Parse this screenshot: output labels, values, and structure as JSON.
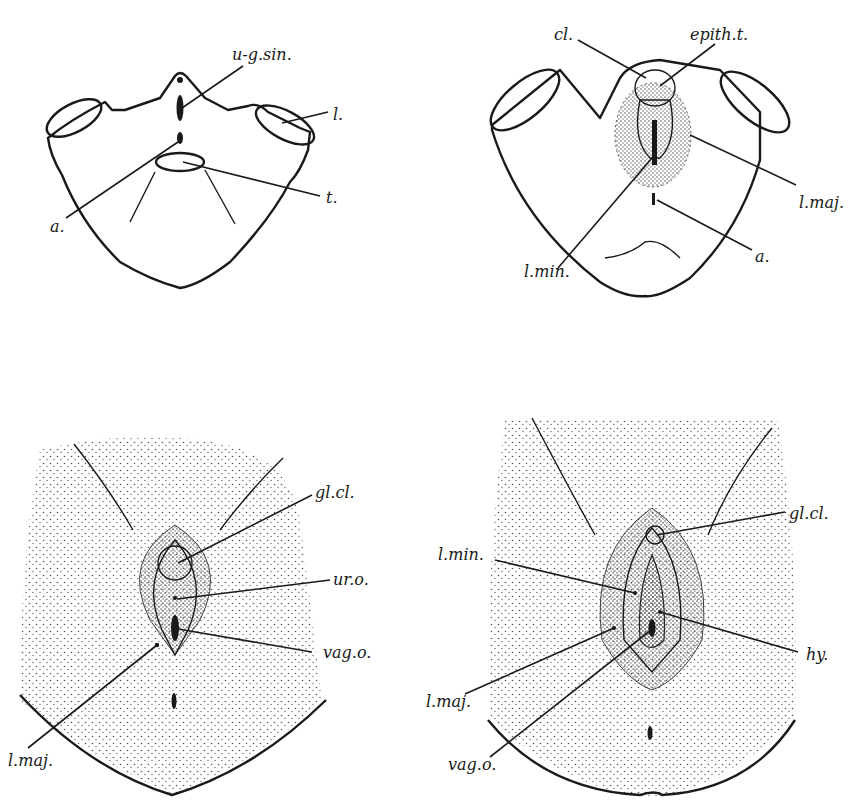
{
  "figure": {
    "panels": [
      {
        "id": "top-left",
        "labels": [
          {
            "text": "u-g.sin.",
            "meaning": "urogenital sinus"
          },
          {
            "text": "l.",
            "meaning": "leg"
          },
          {
            "text": "t.",
            "meaning": "tail"
          },
          {
            "text": "a.",
            "meaning": "anus"
          }
        ]
      },
      {
        "id": "top-right",
        "labels": [
          {
            "text": "cl.",
            "meaning": "clitoris"
          },
          {
            "text": "epith.t.",
            "meaning": "epithelial tag"
          },
          {
            "text": "l.maj.",
            "meaning": "labium majus"
          },
          {
            "text": "l.min.",
            "meaning": "labium minus"
          },
          {
            "text": "a.",
            "meaning": "anus"
          }
        ]
      },
      {
        "id": "bottom-left",
        "labels": [
          {
            "text": "gl.cl.",
            "meaning": "glans clitoridis"
          },
          {
            "text": "ur.o.",
            "meaning": "urethral orifice"
          },
          {
            "text": "vag.o.",
            "meaning": "vaginal orifice"
          },
          {
            "text": "l.maj.",
            "meaning": "labium majus"
          }
        ]
      },
      {
        "id": "bottom-right",
        "labels": [
          {
            "text": "gl.cl.",
            "meaning": "glans clitoridis"
          },
          {
            "text": "l.min.",
            "meaning": "labium minus"
          },
          {
            "text": "hy.",
            "meaning": "hymen"
          },
          {
            "text": "l.maj.",
            "meaning": "labium majus"
          },
          {
            "text": "vag.o.",
            "meaning": "vaginal orifice"
          }
        ]
      }
    ]
  },
  "colors": {
    "ink": "#1a1a1a",
    "paper": "#ffffff",
    "stipple": "#555555"
  }
}
